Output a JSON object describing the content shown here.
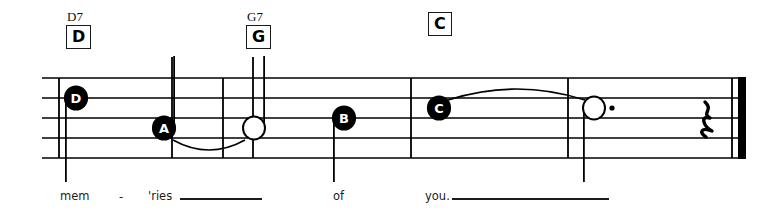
{
  "score": {
    "staff": {
      "line_count": 5,
      "left": 42,
      "right": 745,
      "top": 78,
      "line_spacing": 20
    },
    "chords": [
      {
        "name": "chord-d7",
        "superscript": "D7",
        "box_label": "D",
        "x": 66,
        "sup_y": 10,
        "box_y": 28
      },
      {
        "name": "chord-g7",
        "superscript": "G7",
        "box_label": "G",
        "x": 246,
        "sup_y": 10,
        "box_y": 28
      },
      {
        "name": "chord-c",
        "superscript": "",
        "box_label": "C",
        "x": 428,
        "sup_y": 10,
        "box_y": 28
      }
    ],
    "notes": [
      {
        "name": "note-d",
        "letter": "D",
        "filled": true,
        "x": 76,
        "y": 98,
        "stem": "down",
        "dotted": false
      },
      {
        "name": "note-a",
        "letter": "A",
        "filled": true,
        "x": 164,
        "y": 128,
        "stem": "up",
        "dotted": false
      },
      {
        "name": "note-tied-open-1",
        "letter": "",
        "filled": false,
        "x": 254,
        "y": 128,
        "stem": "up",
        "dotted": false
      },
      {
        "name": "note-b",
        "letter": "B",
        "filled": true,
        "x": 344,
        "y": 118,
        "stem": "down",
        "dotted": false
      },
      {
        "name": "note-c",
        "letter": "C",
        "filled": true,
        "x": 439,
        "y": 108,
        "stem": "none",
        "dotted": false
      },
      {
        "name": "note-tied-open-2",
        "letter": "",
        "filled": false,
        "x": 594,
        "y": 108,
        "stem": "down",
        "dotted": true
      }
    ],
    "ties": [
      {
        "name": "tie-a-to-open",
        "from_x": 164,
        "to_x": 254,
        "y": 140,
        "direction": "below"
      },
      {
        "name": "tie-c-to-open",
        "from_x": 439,
        "to_x": 594,
        "y": 100,
        "direction": "above"
      }
    ],
    "barlines": [
      {
        "name": "barline-start",
        "x": 59
      },
      {
        "name": "barline-1",
        "x": 223
      },
      {
        "name": "barline-2",
        "x": 411
      },
      {
        "name": "barline-3",
        "x": 568
      }
    ],
    "final_barline": {
      "name": "final-barline",
      "thin_x": 732,
      "thick_x": 738,
      "thick_width": 8
    },
    "rest": {
      "name": "quarter-rest",
      "symbol": "quarter-rest",
      "x": 705,
      "y": 118
    },
    "extra_stems": [
      {
        "name": "stem-above-a",
        "x": 172,
        "y_top": 57,
        "y_bottom": 158
      },
      {
        "name": "stem-above-g",
        "x": 253,
        "y_top": 57,
        "y_bottom": 158
      }
    ]
  },
  "lyrics": [
    {
      "name": "lyric-mem",
      "text": "mem",
      "x": 60,
      "y": 190
    },
    {
      "name": "lyric-hyphen",
      "text": "-",
      "x": 119,
      "y": 190
    },
    {
      "name": "lyric-ries",
      "text": "'ries",
      "x": 148,
      "y": 190
    },
    {
      "name": "lyric-of",
      "text": "of",
      "x": 333,
      "y": 190
    },
    {
      "name": "lyric-you",
      "text": "you.",
      "x": 425,
      "y": 190
    }
  ],
  "melismas": [
    {
      "name": "melisma-ries",
      "x": 180,
      "y": 198,
      "width": 82
    },
    {
      "name": "melisma-you",
      "x": 452,
      "y": 198,
      "width": 157
    }
  ],
  "colors": {
    "ink": "#000000",
    "paper": "#ffffff"
  }
}
